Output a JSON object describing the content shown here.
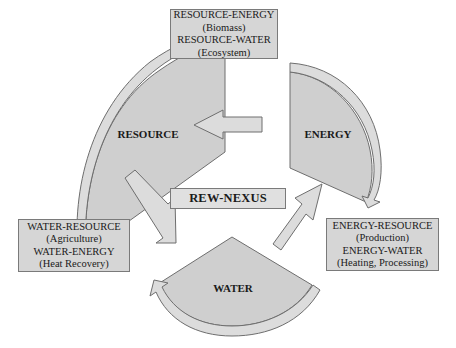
{
  "title": "REW-NEXUS",
  "colors": {
    "shape_fill": "#cfcfcf",
    "arrow_fill": "#d9d9d9",
    "stroke": "#6e6e6e",
    "box_fill": "#d6d6d6",
    "text": "#1a1a1a",
    "background": "#ffffff"
  },
  "nodes": {
    "resource": {
      "label": "RESOURCE"
    },
    "energy": {
      "label": "ENERGY"
    },
    "water": {
      "label": "WATER"
    }
  },
  "center": {
    "label": "REW-NEXUS"
  },
  "boxes": {
    "top": {
      "lines": [
        "RESOURCE-ENERGY",
        "(Biomass)",
        "RESOURCE-WATER",
        "(Ecosystem)"
      ]
    },
    "left": {
      "lines": [
        "WATER-RESOURCE",
        "(Agriculture)",
        "WATER-ENERGY",
        "(Heat Recovery)"
      ]
    },
    "right": {
      "lines": [
        "ENERGY-RESOURCE",
        "(Production)",
        "ENERGY-WATER",
        "(Heating, Processing)"
      ]
    }
  },
  "arrows": [
    {
      "name": "energy-to-resource",
      "direction": "left"
    },
    {
      "name": "resource-to-water",
      "direction": "down-right"
    },
    {
      "name": "water-to-energy",
      "direction": "up-right"
    },
    {
      "name": "resource-cycle",
      "direction": "clockwise"
    },
    {
      "name": "energy-cycle",
      "direction": "clockwise"
    },
    {
      "name": "water-cycle",
      "direction": "clockwise"
    }
  ]
}
